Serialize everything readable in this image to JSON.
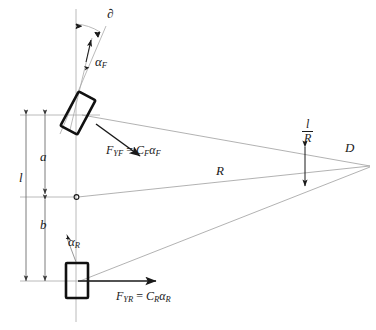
{
  "figure": {
    "background_color": "#ffffff",
    "ink_color": "#1a1a1a",
    "thin_line_color": "#9a9a9a",
    "width": 376,
    "height": 330
  },
  "labels": {
    "steer_angle": "∂",
    "front_slip_angle_alpha": "α",
    "front_slip_angle_sub": "F",
    "rear_slip_angle_alpha": "α",
    "rear_slip_angle_sub": "R",
    "dim_a": "a",
    "dim_b": "b",
    "dim_l": "l",
    "radius_R": "R",
    "center_point": "o",
    "instant_center": "D",
    "ackermann_numerator": "l",
    "ackermann_denominator": "R"
  },
  "equations": {
    "front_force": {
      "lhs_symbol": "F",
      "lhs_sub": "YF",
      "equals": "=",
      "rhs_coeff": "C",
      "rhs_coeff_sub": "F",
      "rhs_alpha": "α",
      "rhs_alpha_sub": "F",
      "plain": "F_YF = C_F α_F"
    },
    "rear_force": {
      "lhs_symbol": "F",
      "lhs_sub": "YR",
      "equals": "=",
      "rhs_coeff": "C",
      "rhs_coeff_sub": "R",
      "rhs_alpha": "α",
      "rhs_alpha_sub": "R",
      "plain": "F_YR = C_R α_R"
    }
  },
  "elements": {
    "front_tire": "front-tire-rectangle",
    "rear_tire": "rear-tire-rectangle",
    "centerline": "vehicle-longitudinal-centerline",
    "front_axle_line": "front-axle-line",
    "rear_axle_line": "rear-axle-line",
    "cg_axle_line": "cg-lateral-line",
    "radius_ray_front": "front-radius-ray",
    "radius_ray_cg": "cg-radius-ray",
    "radius_ray_rear": "rear-radius-ray",
    "steer_arc": "steer-angle-arc",
    "ackermann_arrow": "ackermann-angle-double-arrow"
  }
}
